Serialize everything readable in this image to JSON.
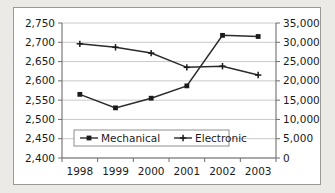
{
  "chart_data": {
    "type": "line",
    "title": "",
    "xlabel": "",
    "ylabel": "",
    "grid": true,
    "legend_position": "inside-bottom-left",
    "categories": [
      "1998",
      "1999",
      "2000",
      "2001",
      "2002",
      "2003"
    ],
    "axes": {
      "x": {
        "tick_labels": [
          "1998",
          "1999",
          "2000",
          "2001",
          "2002",
          "2003"
        ]
      },
      "y_left": {
        "label": "",
        "min": 2400,
        "max": 2750,
        "step": 50,
        "tick_labels": [
          "2,750",
          "2,700",
          "2,650",
          "2,600",
          "2,550",
          "2,500",
          "2,450",
          "2,400"
        ],
        "tick_values": [
          2750,
          2700,
          2650,
          2600,
          2550,
          2500,
          2450,
          2400
        ],
        "series": "Electronic"
      },
      "y_right": {
        "label": "",
        "min": 0,
        "max": 35000,
        "step": 5000,
        "tick_labels": [
          "35,000",
          "30,000",
          "25,000",
          "20,000",
          "15,000",
          "10,000",
          "5,000",
          "0"
        ],
        "tick_values": [
          35000,
          30000,
          25000,
          20000,
          15000,
          10000,
          5000,
          0
        ],
        "series": "Mechanical"
      }
    },
    "series": [
      {
        "name": "Mechanical",
        "axis": "right",
        "marker": "square",
        "color": "#1b1b1b",
        "values": [
          16500,
          13000,
          15500,
          18700,
          31800,
          31500
        ]
      },
      {
        "name": "Electronic",
        "axis": "left",
        "marker": "cross",
        "color": "#1b1b1b",
        "values": [
          2696,
          2687,
          2672,
          2635,
          2638,
          2615
        ]
      }
    ]
  },
  "legend": {
    "items": [
      {
        "label": "Mechanical",
        "marker": "square"
      },
      {
        "label": "Electronic",
        "marker": "cross"
      }
    ]
  },
  "colors": {
    "page_background": "#eceae6",
    "panel_background": "#ffffff",
    "panel_border": "#9a9a94",
    "gridline": "#c9c9c9",
    "axis": "#6e6e6e",
    "series": "#1b1b1b",
    "text": "#1b1b1b"
  }
}
